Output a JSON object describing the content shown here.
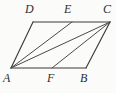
{
  "figure": {
    "kind": "geometry-diagram",
    "shape": "parallelogram",
    "background_color": "#fbfbfa",
    "line_color": "#3b3b3b",
    "label_color": "#2e2e2e",
    "points": {
      "A": {
        "label": "A",
        "x": 11,
        "y": 68,
        "label_x": 3,
        "label_y": 72
      },
      "B": {
        "label": "B",
        "x": 86,
        "y": 68,
        "label_x": 80,
        "label_y": 72
      },
      "C": {
        "label": "C",
        "x": 110,
        "y": 22,
        "label_x": 103,
        "label_y": 3
      },
      "D": {
        "label": "D",
        "x": 33,
        "y": 22,
        "label_x": 25,
        "label_y": 3
      },
      "E": {
        "label": "E",
        "x": 72,
        "y": 22,
        "label_x": 64,
        "label_y": 3
      },
      "F": {
        "label": "F",
        "x": 52,
        "y": 68,
        "label_x": 47,
        "label_y": 72
      }
    },
    "outline_path": "M 11 68 L 86 68 L 110 22 L 33 22 Z",
    "segments": [
      {
        "name": "side-AB",
        "from": "A",
        "to": "B",
        "d": "M 11 68 L 86 68"
      },
      {
        "name": "side-BC",
        "from": "B",
        "to": "C",
        "d": "M 86 68 L 110 22"
      },
      {
        "name": "side-CD",
        "from": "C",
        "to": "D",
        "d": "M 110 22 L 33 22"
      },
      {
        "name": "side-DA",
        "from": "D",
        "to": "A",
        "d": "M 33 22 L 11 68"
      },
      {
        "name": "segment-AE",
        "from": "A",
        "to": "E",
        "d": "M 11 68 L 72 22"
      },
      {
        "name": "segment-AC",
        "from": "A",
        "to": "C",
        "d": "M 11 68 L 110 22"
      },
      {
        "name": "segment-FC",
        "from": "F",
        "to": "C",
        "d": "M 52 68 L 110 22"
      }
    ]
  }
}
